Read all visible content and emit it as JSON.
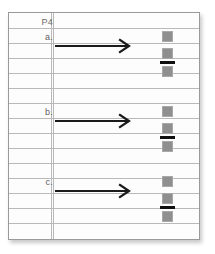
{
  "page": {
    "card_label": "P4",
    "background_color": "#ffffff",
    "paper_color": "#fdfdfd",
    "rule_color": "#b9b9b9",
    "border_color": "#9a9a9a",
    "marker_color": "#8f8f8f",
    "bar_color": "#101010",
    "arrow_color": "#1a1a1a",
    "label_color": "#5d5d5d"
  },
  "header": {
    "label": "P4"
  },
  "items": [
    {
      "label": "a.",
      "arrow": "right-arrow",
      "markers": [
        "square",
        "square",
        "square"
      ],
      "bar": "underline-bar"
    },
    {
      "label": "b.",
      "arrow": "right-arrow",
      "markers": [
        "square",
        "square",
        "square"
      ],
      "bar": "underline-bar"
    },
    {
      "label": "c.",
      "arrow": "right-arrow",
      "markers": [
        "square",
        "square",
        "square"
      ],
      "bar": "underline-bar"
    }
  ]
}
